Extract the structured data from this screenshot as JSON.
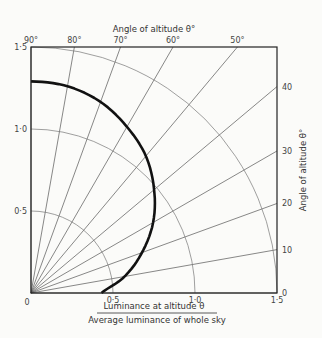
{
  "chart_data": {
    "type": "line",
    "subtype": "polar-quadrant",
    "title": "",
    "top_label": "Angle of altitude θ°",
    "right_label": "Angle of altitude θ°",
    "xlabel_numerator": "Luminance at altitude θ",
    "xlabel_denominator": "Average luminance of whole sky",
    "radial_range": [
      0,
      1.5
    ],
    "x_ticks": [
      {
        "value": 0,
        "label": "0"
      },
      {
        "value": 0.5,
        "label": "0·5"
      },
      {
        "value": 1.0,
        "label": "1·0"
      },
      {
        "value": 1.5,
        "label": "1·5"
      }
    ],
    "y_ticks": [
      {
        "value": 0.5,
        "label": "0·5"
      },
      {
        "value": 1.0,
        "label": "1·0"
      },
      {
        "value": 1.5,
        "label": "1·5"
      }
    ],
    "arcs": [
      0.5,
      1.0,
      1.5
    ],
    "angle_lines_deg": [
      0,
      10,
      20,
      30,
      40,
      50,
      60,
      70,
      80,
      90
    ],
    "top_angle_labels": [
      {
        "deg": 90,
        "label": "90°"
      },
      {
        "deg": 80,
        "label": "80°"
      },
      {
        "deg": 70,
        "label": "70°"
      },
      {
        "deg": 60,
        "label": "60°"
      },
      {
        "deg": 50,
        "label": "50°"
      }
    ],
    "right_angle_labels": [
      {
        "deg": 40,
        "label": "40"
      },
      {
        "deg": 30,
        "label": "30"
      },
      {
        "deg": 20,
        "label": "20"
      },
      {
        "deg": 10,
        "label": "10"
      },
      {
        "deg": 0,
        "label": "0"
      }
    ],
    "series": [
      {
        "name": "Relative luminance (overcast sky)",
        "angle_deg": [
          0,
          10,
          20,
          30,
          40,
          50,
          60,
          70,
          80,
          90
        ],
        "r": [
          0.43,
          0.58,
          0.72,
          0.86,
          0.98,
          1.09,
          1.17,
          1.24,
          1.28,
          1.29
        ]
      }
    ],
    "grid": true,
    "legend": "none"
  }
}
